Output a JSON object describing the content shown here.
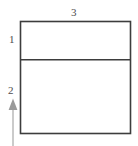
{
  "figure": {
    "type": "geometry-diagram",
    "background_color": "#ffffff",
    "stroke_color": "#3d3d3d",
    "arrow_color": "#a9a9a9",
    "label_color": "#4d4d4d",
    "labels": {
      "top": "3",
      "left_band": "1",
      "arrow": "2"
    },
    "shapes": {
      "outer_rectangle": {
        "x": 20,
        "y": 21,
        "width": 111,
        "height": 113
      },
      "divider_line": {
        "x1": 20,
        "y1": 59.5,
        "x2": 131,
        "y2": 59.5
      },
      "arrow": {
        "x": 13,
        "tip_y": 99,
        "tail_y": 146,
        "head_height": 11,
        "head_width": 9
      }
    }
  }
}
